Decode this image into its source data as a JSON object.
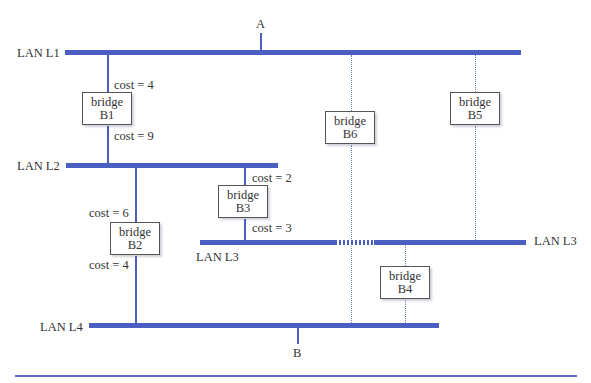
{
  "diagram": {
    "type": "bridged-LAN spanning tree",
    "colors": {
      "lan_line": "#4a5fc1",
      "inactive_link": "#6f80cf",
      "text": "#333333",
      "box_border": "#555555"
    },
    "endpoints": {
      "a": "A",
      "b": "B"
    },
    "lans": {
      "l1": "LAN L1",
      "l2": "LAN L2",
      "l3_left": "LAN L3",
      "l3_right": "LAN L3",
      "l4": "LAN L4"
    },
    "bridges": {
      "b1": {
        "word": "bridge",
        "id": "B1",
        "cost_up": "cost = 4",
        "cost_down": "cost = 9",
        "active": true
      },
      "b2": {
        "word": "bridge",
        "id": "B2",
        "cost_up": "cost = 6",
        "cost_down": "cost = 4",
        "active": true
      },
      "b3": {
        "word": "bridge",
        "id": "B3",
        "cost_up": "cost = 2",
        "cost_down": "cost = 3",
        "active": true
      },
      "b4": {
        "word": "bridge",
        "id": "B4",
        "active": false
      },
      "b5": {
        "word": "bridge",
        "id": "B5",
        "active": false
      },
      "b6": {
        "word": "bridge",
        "id": "B6",
        "active": false
      }
    }
  }
}
